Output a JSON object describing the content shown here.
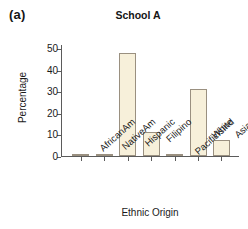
{
  "figure": {
    "panel_label": "(a)",
    "background_color": "#ffffff",
    "bar_fill_color": "#f7f0da",
    "bar_edge_color": "#9a9080",
    "axis_color": "#5b5b5b",
    "text_color": "#1a1a1a"
  },
  "chart_data": {
    "type": "bar",
    "title": "School A",
    "xlabel": "Ethnic Origin",
    "ylabel": "Percentage",
    "categories": [
      "AfricanAm",
      "NativeAm",
      "Hispanic",
      "Filipino",
      "PacificIsInd",
      "White",
      "Asian"
    ],
    "values": [
      1,
      0.5,
      48,
      11,
      0.5,
      31,
      7.5
    ],
    "ylim": [
      0,
      52
    ],
    "yticks": [
      0,
      10,
      20,
      30,
      40,
      50
    ],
    "ytick_labels": [
      "0",
      "10",
      "20",
      "30",
      "40",
      "50"
    ],
    "grid": false,
    "legend": null,
    "annotations": []
  }
}
